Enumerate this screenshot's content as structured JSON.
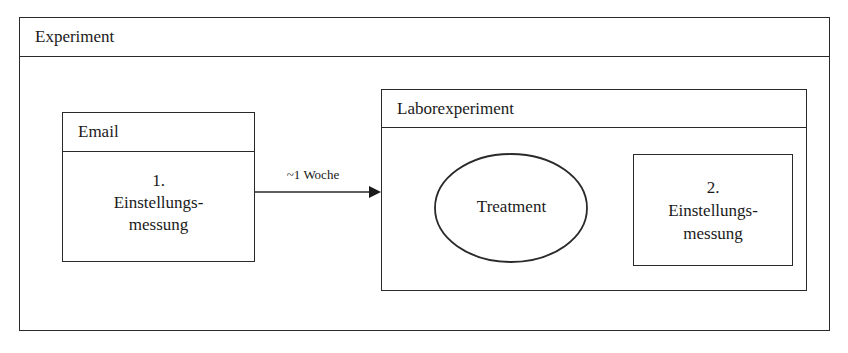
{
  "diagram": {
    "outer": {
      "title": "Experiment"
    },
    "email": {
      "title": "Email",
      "step_number": "1.",
      "line1": "Einstellungs-",
      "line2": "messung"
    },
    "arrow": {
      "label": "~1 Woche"
    },
    "labor": {
      "title": "Laborexperiment",
      "treatment": "Treatment",
      "measure": {
        "step_number": "2.",
        "line1": "Einstellungs-",
        "line2": "messung"
      }
    },
    "colors": {
      "stroke": "#2a2a2a",
      "background": "#ffffff"
    }
  }
}
